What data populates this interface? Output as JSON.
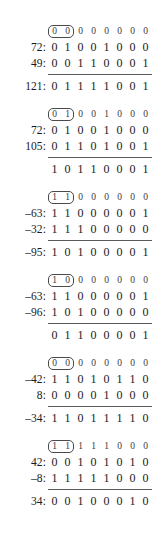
{
  "document": {
    "title": "Binary two's-complement addition worked examples",
    "digit_count": 8,
    "carry_box_digits": 2,
    "colors": {
      "text": "#1a1a1a",
      "carry_text": "#3a3a3a",
      "rule": "#5a5a5a",
      "carry_box_border": "#4a4a4a",
      "background": "#ffffff"
    }
  },
  "blocks": [
    {
      "id": "block-1",
      "carry": {
        "label": "",
        "digits": [
          "0",
          "0",
          "0",
          "0",
          "0",
          "0",
          "0",
          "0"
        ]
      },
      "addend1": {
        "label": "72:",
        "digits": [
          "0",
          "1",
          "0",
          "0",
          "1",
          "0",
          "0",
          "0"
        ]
      },
      "addend2": {
        "label": "49:",
        "digits": [
          "0",
          "0",
          "1",
          "1",
          "0",
          "0",
          "0",
          "1"
        ]
      },
      "sum": {
        "label": "121:",
        "digits": [
          "0",
          "1",
          "1",
          "1",
          "1",
          "0",
          "0",
          "1"
        ]
      }
    },
    {
      "id": "block-2",
      "carry": {
        "label": "",
        "digits": [
          "0",
          "1",
          "0",
          "0",
          "1",
          "0",
          "0",
          "0"
        ]
      },
      "addend1": {
        "label": "72:",
        "digits": [
          "0",
          "1",
          "0",
          "0",
          "1",
          "0",
          "0",
          "0"
        ]
      },
      "addend2": {
        "label": "105:",
        "digits": [
          "0",
          "1",
          "1",
          "0",
          "1",
          "0",
          "0",
          "1"
        ]
      },
      "sum": {
        "label": "",
        "digits": [
          "1",
          "0",
          "1",
          "1",
          "0",
          "0",
          "0",
          "1"
        ]
      }
    },
    {
      "id": "block-3",
      "carry": {
        "label": "",
        "digits": [
          "1",
          "1",
          "0",
          "0",
          "0",
          "0",
          "0",
          "0"
        ]
      },
      "addend1": {
        "label": "–63:",
        "digits": [
          "1",
          "1",
          "0",
          "0",
          "0",
          "0",
          "0",
          "1"
        ]
      },
      "addend2": {
        "label": "–32:",
        "digits": [
          "1",
          "1",
          "1",
          "0",
          "0",
          "0",
          "0",
          "0"
        ]
      },
      "sum": {
        "label": "–95:",
        "digits": [
          "1",
          "0",
          "1",
          "0",
          "0",
          "0",
          "0",
          "1"
        ]
      }
    },
    {
      "id": "block-4",
      "carry": {
        "label": "",
        "digits": [
          "1",
          "0",
          "0",
          "0",
          "0",
          "0",
          "0",
          "0"
        ]
      },
      "addend1": {
        "label": "–63:",
        "digits": [
          "1",
          "1",
          "0",
          "0",
          "0",
          "0",
          "0",
          "1"
        ]
      },
      "addend2": {
        "label": "–96:",
        "digits": [
          "1",
          "0",
          "1",
          "0",
          "0",
          "0",
          "0",
          "0"
        ]
      },
      "sum": {
        "label": "",
        "digits": [
          "0",
          "1",
          "1",
          "0",
          "0",
          "0",
          "0",
          "1"
        ]
      }
    },
    {
      "id": "block-5",
      "carry": {
        "label": "",
        "digits": [
          "0",
          "0",
          "0",
          "0",
          "0",
          "0",
          "0",
          "0"
        ]
      },
      "addend1": {
        "label": "–42:",
        "digits": [
          "1",
          "1",
          "0",
          "1",
          "0",
          "1",
          "1",
          "0"
        ]
      },
      "addend2": {
        "label": "8:",
        "digits": [
          "0",
          "0",
          "0",
          "0",
          "1",
          "0",
          "0",
          "0"
        ]
      },
      "sum": {
        "label": "–34:",
        "digits": [
          "1",
          "1",
          "0",
          "1",
          "1",
          "1",
          "1",
          "0"
        ]
      }
    },
    {
      "id": "block-6",
      "carry": {
        "label": "",
        "digits": [
          "1",
          "1",
          "1",
          "1",
          "1",
          "0",
          "0",
          "0"
        ]
      },
      "addend1": {
        "label": "42:",
        "digits": [
          "0",
          "0",
          "1",
          "0",
          "1",
          "0",
          "1",
          "0"
        ]
      },
      "addend2": {
        "label": "–8:",
        "digits": [
          "1",
          "1",
          "1",
          "1",
          "1",
          "0",
          "0",
          "0"
        ]
      },
      "sum": {
        "label": "34:",
        "digits": [
          "0",
          "0",
          "1",
          "0",
          "0",
          "0",
          "1",
          "0"
        ]
      }
    }
  ]
}
